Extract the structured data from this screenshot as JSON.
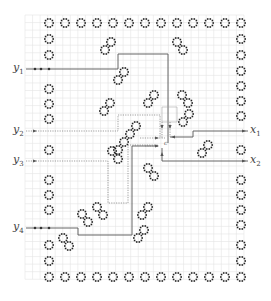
{
  "diagram": {
    "type": "circuit-layout-grid",
    "grid": {
      "x0": 25,
      "y0": 15,
      "cell": 7.55,
      "cols": 29,
      "rows": 35,
      "color": "#e4e4e4"
    },
    "colors": {
      "ring": "#222222",
      "wire": "#555555",
      "wire_dotted": "#777777",
      "label": "#444444"
    },
    "inputs": [
      {
        "id": "y1",
        "label": "y",
        "sub": "1",
        "y": 69,
        "style": "solid-dots"
      },
      {
        "id": "y2",
        "label": "y",
        "sub": "2",
        "y": 131,
        "style": "dotted-arrow"
      },
      {
        "id": "y3",
        "label": "y",
        "sub": "3",
        "y": 161,
        "style": "dotted-arrow"
      },
      {
        "id": "y4",
        "label": "y",
        "sub": "4",
        "y": 228,
        "style": "solid-dots"
      }
    ],
    "outputs": [
      {
        "id": "x1",
        "label": "x",
        "sub": "1",
        "y": 131
      },
      {
        "id": "x2",
        "label": "x",
        "sub": "2",
        "y": 161
      }
    ],
    "center_marker": {
      "label": "c",
      "x": 164,
      "y": 143
    },
    "border_rings": {
      "top": {
        "y": 23,
        "xs": [
          49,
          65,
          81,
          97,
          113,
          129,
          145,
          161,
          177,
          193,
          209,
          225,
          241
        ]
      },
      "bottom": {
        "y": 277,
        "xs": [
          49,
          65,
          81,
          97,
          113,
          129,
          145,
          161,
          177,
          193,
          209,
          225,
          241
        ]
      },
      "left": {
        "x": 49,
        "ys": [
          39,
          55,
          89,
          104,
          119,
          150,
          180,
          195,
          210,
          245,
          261
        ]
      },
      "right": {
        "x": 241,
        "ys": [
          39,
          55,
          71,
          86,
          101,
          116,
          150,
          180,
          195,
          210,
          225,
          245,
          261
        ]
      }
    },
    "pair_rings": [
      {
        "x1": 177,
        "y1": 42,
        "x2": 183,
        "y2": 50
      },
      {
        "x1": 105,
        "y1": 50,
        "x2": 111,
        "y2": 42
      },
      {
        "x1": 118,
        "y1": 80,
        "x2": 124,
        "y2": 72
      },
      {
        "x1": 104,
        "y1": 111,
        "x2": 110,
        "y2": 103
      },
      {
        "x1": 148,
        "y1": 103,
        "x2": 154,
        "y2": 95
      },
      {
        "x1": 182,
        "y1": 95,
        "x2": 188,
        "y2": 103
      },
      {
        "x1": 183,
        "y1": 122,
        "x2": 189,
        "y2": 114
      },
      {
        "x1": 118,
        "y1": 150,
        "x2": 124,
        "y2": 142
      },
      {
        "x1": 130,
        "y1": 134,
        "x2": 136,
        "y2": 126
      },
      {
        "x1": 112,
        "y1": 151,
        "x2": 118,
        "y2": 159
      },
      {
        "x1": 148,
        "y1": 168,
        "x2": 154,
        "y2": 176
      },
      {
        "x1": 202,
        "y1": 153,
        "x2": 208,
        "y2": 145
      },
      {
        "x1": 97,
        "y1": 207,
        "x2": 103,
        "y2": 215
      },
      {
        "x1": 82,
        "y1": 214,
        "x2": 88,
        "y2": 222
      },
      {
        "x1": 142,
        "y1": 215,
        "x2": 148,
        "y2": 207
      },
      {
        "x1": 63,
        "y1": 238,
        "x2": 69,
        "y2": 246
      },
      {
        "x1": 138,
        "y1": 238,
        "x2": 144,
        "y2": 230
      }
    ],
    "wires": [
      {
        "name": "y1-wire",
        "style": "solid",
        "points": [
          [
            26,
            69
          ],
          [
            118,
            69
          ],
          [
            118,
            54
          ],
          [
            168,
            54
          ],
          [
            168,
            143
          ]
        ]
      },
      {
        "name": "y2-wire",
        "style": "dotted",
        "points": [
          [
            26,
            131
          ],
          [
            118,
            131
          ],
          [
            118,
            115
          ],
          [
            160,
            115
          ],
          [
            160,
            138
          ]
        ]
      },
      {
        "name": "y3-wire",
        "style": "dotted",
        "points": [
          [
            26,
            161
          ],
          [
            108,
            161
          ],
          [
            108,
            203
          ],
          [
            128,
            203
          ],
          [
            128,
            145
          ],
          [
            158,
            145
          ]
        ]
      },
      {
        "name": "y4-wire",
        "style": "solid",
        "points": [
          [
            26,
            228
          ],
          [
            78,
            228
          ],
          [
            78,
            235
          ],
          [
            132,
            235
          ],
          [
            132,
            146
          ],
          [
            158,
            146
          ]
        ]
      },
      {
        "name": "x1-wire",
        "style": "solid",
        "points": [
          [
            170,
            137
          ],
          [
            193,
            137
          ],
          [
            193,
            131
          ],
          [
            248,
            131
          ]
        ]
      },
      {
        "name": "x2-wire",
        "style": "solid",
        "points": [
          [
            162,
            148
          ],
          [
            162,
            161
          ],
          [
            248,
            161
          ]
        ]
      },
      {
        "name": "center-box",
        "style": "thin",
        "points": [
          [
            162,
            107
          ],
          [
            177,
            107
          ],
          [
            177,
            122
          ],
          [
            162,
            122
          ],
          [
            162,
            107
          ]
        ]
      },
      {
        "name": "c-vert-1",
        "style": "dotted",
        "points": [
          [
            162,
            122
          ],
          [
            162,
            138
          ]
        ]
      },
      {
        "name": "c-vert-2",
        "style": "dotted",
        "points": [
          [
            170,
            122
          ],
          [
            170,
            137
          ]
        ]
      },
      {
        "name": "c-horiz-1",
        "style": "dotted",
        "points": [
          [
            140,
            138
          ],
          [
            165,
            138
          ]
        ]
      },
      {
        "name": "c-horiz-2",
        "style": "dotted",
        "points": [
          [
            145,
            146
          ],
          [
            158,
            146
          ]
        ]
      }
    ],
    "arrows": [
      {
        "x": 36,
        "y": 131,
        "dir": "right"
      },
      {
        "x": 36,
        "y": 161,
        "dir": "right"
      },
      {
        "x": 245,
        "y": 131,
        "dir": "right"
      },
      {
        "x": 245,
        "y": 161,
        "dir": "right"
      },
      {
        "x": 158,
        "y": 138,
        "dir": "right"
      },
      {
        "x": 158,
        "y": 146,
        "dir": "right"
      },
      {
        "x": 162,
        "y": 128,
        "dir": "down"
      },
      {
        "x": 170,
        "y": 128,
        "dir": "down"
      },
      {
        "x": 172,
        "y": 137,
        "dir": "left"
      },
      {
        "x": 162,
        "y": 153,
        "dir": "up"
      }
    ],
    "dots": [
      {
        "x": 35,
        "y": 69
      },
      {
        "x": 41,
        "y": 69
      },
      {
        "x": 49,
        "y": 69
      },
      {
        "x": 35,
        "y": 228
      },
      {
        "x": 41,
        "y": 228
      },
      {
        "x": 49,
        "y": 228
      }
    ]
  }
}
